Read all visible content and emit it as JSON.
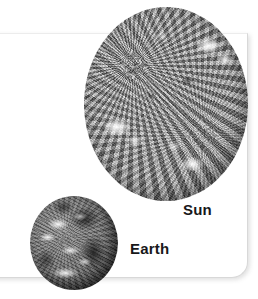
{
  "figure": {
    "type": "size-comparison-illustration",
    "background_color": "#ffffff",
    "panel": {
      "name": "photo-card",
      "fill_color": "#ffffff",
      "border_color": "#d8d8d8",
      "corner": "rounded-bottom-right"
    }
  },
  "bodies": [
    {
      "id": "sun",
      "label": "Sun",
      "appearance": "grayscale textured photosphere with bright active regions",
      "tone_color": "#a4a4a4",
      "highlight_color": "#ffffff",
      "shadow_color": "#5d5d5d"
    },
    {
      "id": "earth",
      "label": "Earth",
      "appearance": "grayscale globe showing continents and cloud bands",
      "tone_color": "#6a6a6a",
      "highlight_color": "#ffffff",
      "shadow_color": "#101010"
    }
  ],
  "labels": {
    "sun": "Sun",
    "earth": "Earth",
    "text_color": "#18181a"
  }
}
